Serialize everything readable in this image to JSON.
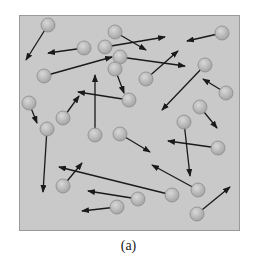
{
  "figure": {
    "caption": "(a)",
    "colors": {
      "box_fill": "#c9c9c9",
      "box_border": "#9a9a9a",
      "molecule_fill": "#b5b5b5",
      "molecule_stroke": "#8c8c8c",
      "arrow": "#1a1a1a"
    },
    "molecule_radius": 7,
    "molecules": [
      {
        "x": 48,
        "y": 25,
        "vx": 26,
        "vy": 60
      },
      {
        "x": 115,
        "y": 32,
        "vx": 146,
        "vy": 50
      },
      {
        "x": 222,
        "y": 33,
        "vx": 187,
        "vy": 41
      },
      {
        "x": 84,
        "y": 48,
        "vx": 48,
        "vy": 53
      },
      {
        "x": 105,
        "y": 47,
        "vx": 165,
        "vy": 37
      },
      {
        "x": 120,
        "y": 57,
        "vx": 185,
        "vy": 66
      },
      {
        "x": 44,
        "y": 76,
        "vx": 112,
        "vy": 57
      },
      {
        "x": 115,
        "y": 69,
        "vx": 124,
        "vy": 93
      },
      {
        "x": 146,
        "y": 79,
        "vx": 178,
        "vy": 51
      },
      {
        "x": 205,
        "y": 65,
        "vx": 162,
        "vy": 110
      },
      {
        "x": 226,
        "y": 93,
        "vx": 203,
        "vy": 79
      },
      {
        "x": 129,
        "y": 100,
        "vx": 78,
        "vy": 92
      },
      {
        "x": 29,
        "y": 103,
        "vx": 37,
        "vy": 123
      },
      {
        "x": 63,
        "y": 118,
        "vx": 79,
        "vy": 96
      },
      {
        "x": 200,
        "y": 107,
        "vx": 217,
        "vy": 128
      },
      {
        "x": 47,
        "y": 129,
        "vx": 43,
        "vy": 192
      },
      {
        "x": 95,
        "y": 135,
        "vx": 95,
        "vy": 75
      },
      {
        "x": 120,
        "y": 134,
        "vx": 150,
        "vy": 152
      },
      {
        "x": 184,
        "y": 122,
        "vx": 190,
        "vy": 176
      },
      {
        "x": 218,
        "y": 148,
        "vx": 168,
        "vy": 141
      },
      {
        "x": 63,
        "y": 186,
        "vx": 82,
        "vy": 163
      },
      {
        "x": 172,
        "y": 195,
        "vx": 59,
        "vy": 167
      },
      {
        "x": 198,
        "y": 190,
        "vx": 152,
        "vy": 165
      },
      {
        "x": 138,
        "y": 199,
        "vx": 88,
        "vy": 191
      },
      {
        "x": 117,
        "y": 207,
        "vx": 82,
        "vy": 211
      },
      {
        "x": 197,
        "y": 214,
        "vx": 230,
        "vy": 187
      }
    ]
  }
}
